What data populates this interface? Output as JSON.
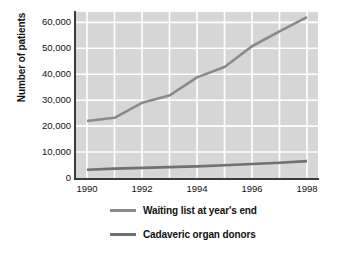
{
  "chart_data": {
    "type": "line",
    "title": "",
    "subtitle": "",
    "xlabel": "",
    "ylabel": "Number of patients",
    "x": [
      1990,
      1991,
      1992,
      1993,
      1994,
      1995,
      1996,
      1997,
      1998
    ],
    "xlim": [
      1989.6,
      1998.4
    ],
    "ylim": [
      0,
      64000
    ],
    "xticks": [
      "1990",
      "1992",
      "1994",
      "1996",
      "1998"
    ],
    "xtick_values": [
      1990,
      1992,
      1994,
      1996,
      1998
    ],
    "yticks": [
      "0",
      "10,000",
      "20,000",
      "30,000",
      "40,000",
      "50,000",
      "60,000"
    ],
    "ytick_values": [
      0,
      10000,
      20000,
      30000,
      40000,
      50000,
      60000
    ],
    "grid": "both",
    "grid_color": "#ffffff",
    "plot_background": "#d6d6d6",
    "legend_position": "bottom",
    "series": [
      {
        "name": "Waiting list at year's end",
        "color": "#8a8a8a",
        "values": [
          22000,
          23200,
          29000,
          31800,
          38800,
          42800,
          50800,
          56500,
          62000
        ]
      },
      {
        "name": "Cadaveric organ donors",
        "color": "#707070",
        "values": [
          3200,
          3600,
          3900,
          4200,
          4500,
          4900,
          5400,
          5900,
          6500
        ]
      }
    ]
  },
  "legend": {
    "items": [
      {
        "label": "Waiting list at year's end",
        "color": "#8a8a8a"
      },
      {
        "label": "Cadaveric organ donors",
        "color": "#707070"
      }
    ]
  }
}
